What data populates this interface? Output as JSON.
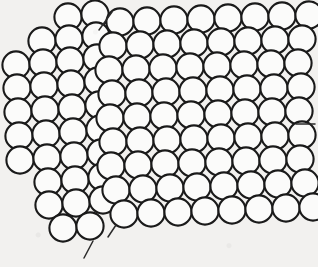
{
  "figure": {
    "kind": "bubble-raft-grain-boundary",
    "caption": "",
    "background_color": "#f2f1ef",
    "circle_fill": "#fbfbfa",
    "circle_stroke": "#1a1a1a",
    "circle_stroke_width": 2.1,
    "circle_radius": 13.6,
    "annotation_color": "#2a2a2a",
    "canvas": {
      "width": 318,
      "height": 267
    }
  },
  "grains": [
    {
      "name": "left-grain",
      "label": "",
      "tilt_degrees": -13,
      "lattice_spacing": 27.4,
      "rows": 9,
      "origin_x": 12,
      "origin_y": 18
    },
    {
      "name": "right-grain",
      "label": "",
      "tilt_degrees": -2.5,
      "lattice_spacing": 27.4,
      "rows": 9,
      "origin_x": 118,
      "origin_y": 14
    }
  ],
  "boundary": {
    "name": "grain-boundary",
    "label": "",
    "orientation": "near-vertical",
    "x_top": 106,
    "x_bottom": 118
  },
  "annotations": [
    {
      "name": "right-edge-pointer",
      "type": "tick-line",
      "label": "",
      "x1": 296,
      "y1": 124,
      "x2": 315,
      "y2": 124
    },
    {
      "name": "bottom-pointer",
      "type": "tick-line",
      "label": "",
      "x1": 84,
      "y1": 258,
      "x2": 93,
      "y2": 241
    },
    {
      "name": "boundary-tick-upper",
      "type": "tick-line",
      "label": "",
      "x1": 99,
      "y1": 30,
      "x2": 112,
      "y2": 12
    },
    {
      "name": "boundary-tick-lower",
      "type": "tick-line",
      "label": "",
      "x1": 108,
      "y1": 237,
      "x2": 116,
      "y2": 225
    }
  ],
  "circles": {
    "left": [
      [
        68,
        17
      ],
      [
        95,
        14
      ],
      [
        42,
        41
      ],
      [
        69,
        39
      ],
      [
        96,
        36
      ],
      [
        16,
        65
      ],
      [
        43,
        63
      ],
      [
        70,
        61
      ],
      [
        97,
        58
      ],
      [
        17,
        88
      ],
      [
        44,
        86
      ],
      [
        71,
        84
      ],
      [
        98,
        81
      ],
      [
        18,
        112
      ],
      [
        45,
        110
      ],
      [
        72,
        108
      ],
      [
        99,
        105
      ],
      [
        19,
        136
      ],
      [
        46,
        134
      ],
      [
        73,
        132
      ],
      [
        100,
        129
      ],
      [
        20,
        160
      ],
      [
        47,
        158
      ],
      [
        74,
        156
      ],
      [
        101,
        153
      ],
      [
        48,
        182
      ],
      [
        75,
        180
      ],
      [
        102,
        177
      ],
      [
        49,
        205
      ],
      [
        76,
        203
      ],
      [
        103,
        200
      ],
      [
        63,
        228
      ],
      [
        90,
        226
      ]
    ],
    "right": [
      [
        120,
        22
      ],
      [
        147,
        21
      ],
      [
        174,
        20
      ],
      [
        201,
        19
      ],
      [
        228,
        18
      ],
      [
        255,
        17
      ],
      [
        282,
        16
      ],
      [
        309,
        15
      ],
      [
        113,
        46
      ],
      [
        140,
        45
      ],
      [
        167,
        44
      ],
      [
        194,
        43
      ],
      [
        221,
        42
      ],
      [
        248,
        41
      ],
      [
        275,
        40
      ],
      [
        302,
        39
      ],
      [
        109,
        70
      ],
      [
        136,
        69
      ],
      [
        163,
        68
      ],
      [
        190,
        67
      ],
      [
        217,
        66
      ],
      [
        244,
        65
      ],
      [
        271,
        64
      ],
      [
        298,
        63
      ],
      [
        112,
        94
      ],
      [
        139,
        93
      ],
      [
        166,
        92
      ],
      [
        193,
        91
      ],
      [
        220,
        90
      ],
      [
        247,
        89
      ],
      [
        274,
        88
      ],
      [
        301,
        87
      ],
      [
        110,
        118
      ],
      [
        137,
        117
      ],
      [
        164,
        116
      ],
      [
        191,
        115
      ],
      [
        218,
        114
      ],
      [
        245,
        113
      ],
      [
        272,
        112
      ],
      [
        299,
        111
      ],
      [
        113,
        142
      ],
      [
        140,
        141
      ],
      [
        167,
        140
      ],
      [
        194,
        139
      ],
      [
        221,
        138
      ],
      [
        248,
        137
      ],
      [
        275,
        136
      ],
      [
        302,
        135
      ],
      [
        111,
        166
      ],
      [
        138,
        165
      ],
      [
        165,
        164
      ],
      [
        192,
        163
      ],
      [
        219,
        162
      ],
      [
        246,
        161
      ],
      [
        273,
        160
      ],
      [
        300,
        159
      ],
      [
        116,
        190
      ],
      [
        143,
        189
      ],
      [
        170,
        188
      ],
      [
        197,
        187
      ],
      [
        224,
        186
      ],
      [
        251,
        185
      ],
      [
        278,
        184
      ],
      [
        305,
        183
      ],
      [
        124,
        214
      ],
      [
        151,
        213
      ],
      [
        178,
        212
      ],
      [
        205,
        211
      ],
      [
        232,
        210
      ],
      [
        259,
        209
      ],
      [
        286,
        208
      ],
      [
        313,
        207
      ]
    ]
  }
}
